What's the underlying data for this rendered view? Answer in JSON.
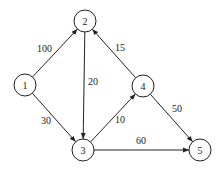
{
  "graph": {
    "type": "directed-weighted",
    "nodes": [
      {
        "id": "1",
        "label": "1",
        "x": 25,
        "y": 85
      },
      {
        "id": "2",
        "label": "2",
        "x": 85,
        "y": 21
      },
      {
        "id": "3",
        "label": "3",
        "x": 83,
        "y": 150
      },
      {
        "id": "4",
        "label": "4",
        "x": 143,
        "y": 86
      },
      {
        "id": "5",
        "label": "5",
        "x": 200,
        "y": 150
      }
    ],
    "edges": [
      {
        "from": "1",
        "to": "2",
        "weight": "100",
        "lx": 37,
        "ly": 52
      },
      {
        "from": "1",
        "to": "3",
        "weight": "30",
        "lx": 41,
        "ly": 124
      },
      {
        "from": "2",
        "to": "3",
        "weight": "20",
        "lx": 88,
        "ly": 85
      },
      {
        "from": "3",
        "to": "4",
        "weight": "10",
        "lx": 115,
        "ly": 123
      },
      {
        "from": "4",
        "to": "2",
        "weight": "15",
        "lx": 115,
        "ly": 51
      },
      {
        "from": "4",
        "to": "5",
        "weight": "50",
        "lx": 172,
        "ly": 112
      },
      {
        "from": "3",
        "to": "5",
        "weight": "60",
        "lx": 136,
        "ly": 144
      }
    ]
  }
}
